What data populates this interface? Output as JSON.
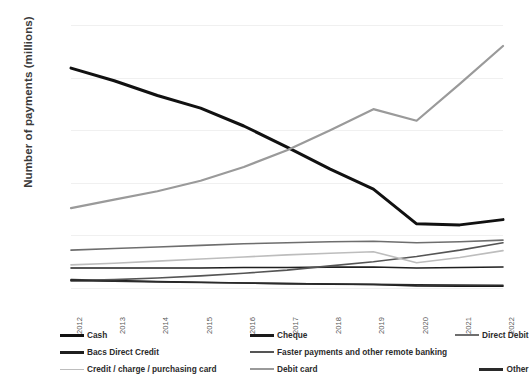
{
  "chart_data": {
    "type": "line",
    "title": "",
    "xlabel": "",
    "ylabel": "Number of payments (millions)",
    "grid": true,
    "legend_position": "bottom",
    "ylim": [
      0,
      25000
    ],
    "ytick_labels": [
      "25,000",
      "20,000",
      "15,000",
      "10,000",
      "5,000",
      "0"
    ],
    "ytick_values": [
      25000,
      20000,
      15000,
      10000,
      5000,
      0
    ],
    "categories": [
      "2012",
      "2013",
      "2014",
      "2015",
      "2016",
      "2017",
      "2018",
      "2019",
      "2020",
      "2021",
      "2022"
    ],
    "series": [
      {
        "name": "Cash",
        "color": "#111111",
        "width": 3.0,
        "values": [
          20900,
          19700,
          18300,
          17100,
          15400,
          13400,
          11300,
          9400,
          6100,
          6000,
          6500
        ]
      },
      {
        "name": "Cheque",
        "color": "#1a1a1a",
        "width": 1.6,
        "values": [
          800,
          700,
          620,
          550,
          480,
          420,
          370,
          330,
          200,
          180,
          160
        ]
      },
      {
        "name": "Direct Debit",
        "color": "#6e6e6e",
        "width": 1.6,
        "values": [
          3600,
          3750,
          3900,
          4050,
          4200,
          4300,
          4400,
          4450,
          4300,
          4400,
          4550
        ]
      },
      {
        "name": "Bacs Direct Credit",
        "color": "#1f1f1f",
        "width": 1.6,
        "values": [
          1900,
          1900,
          1900,
          1900,
          1950,
          1950,
          1980,
          2000,
          1900,
          1950,
          2000
        ]
      },
      {
        "name": "Faster payments and other remote banking",
        "color": "#555555",
        "width": 1.6,
        "values": [
          700,
          800,
          950,
          1150,
          1400,
          1700,
          2100,
          2500,
          3000,
          3600,
          4300
        ]
      },
      {
        "name": "Credit / charge / purchasing card",
        "color": "#bdbdbd",
        "width": 1.6,
        "values": [
          2200,
          2350,
          2550,
          2750,
          2950,
          3150,
          3300,
          3450,
          2400,
          2900,
          3550
        ]
      },
      {
        "name": "Debit card",
        "color": "#9a9a9a",
        "width": 2.2,
        "values": [
          7600,
          8400,
          9200,
          10200,
          11500,
          13100,
          15000,
          17000,
          15900,
          19400,
          23000
        ]
      },
      {
        "name": "Other",
        "color": "#2a2a2a",
        "width": 1.6,
        "values": [
          700,
          640,
          580,
          520,
          470,
          420,
          380,
          340,
          300,
          280,
          260
        ]
      }
    ]
  },
  "legend": {
    "items": [
      {
        "label": "Cash",
        "color": "#111111",
        "width": 3.0
      },
      {
        "label": "Cheque",
        "color": "#1a1a1a",
        "width": 2.6
      },
      {
        "label": "Direct Debit",
        "color": "#6e6e6e",
        "width": 2.0
      },
      {
        "label": "Bacs Direct Credit",
        "color": "#1f1f1f",
        "width": 2.6
      },
      {
        "label": "Faster payments and other remote banking",
        "color": "#555555",
        "width": 2.0
      },
      {
        "label": "",
        "color": "transparent",
        "width": 0
      },
      {
        "label": "Credit / charge / purchasing card",
        "color": "#bdbdbd",
        "width": 1.8
      },
      {
        "label": "Debit card",
        "color": "#9a9a9a",
        "width": 2.0
      },
      {
        "label": "Other",
        "color": "#2a2a2a",
        "width": 2.6
      }
    ]
  }
}
